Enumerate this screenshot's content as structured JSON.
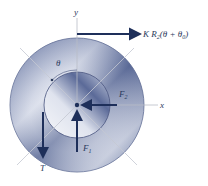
{
  "diagram": {
    "title": "",
    "axes": {
      "x_label": "x",
      "y_label": "y"
    },
    "angle_label": "θ",
    "forces": {
      "top_force": {
        "label_main": "K R",
        "label_sub": "2",
        "label_expr_open": "(θ + θ",
        "label_expr_sub": "0",
        "label_expr_close": ")",
        "direction": "right"
      },
      "F1": {
        "label": "F",
        "sub": "1",
        "direction": "up"
      },
      "F2": {
        "label": "F",
        "sub": "2",
        "direction": "left"
      },
      "T": {
        "label": "T",
        "direction": "down"
      }
    },
    "colors": {
      "arrow": "#1e2f5a",
      "ring_dark": "#3d4f80",
      "ring_light": "#eef0f6",
      "axis": "#b9bdc6",
      "text": "#2b3a5c"
    }
  }
}
